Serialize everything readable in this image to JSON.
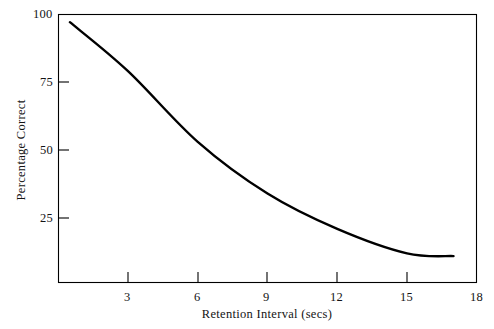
{
  "chart_data": {
    "type": "line",
    "title": "",
    "xlabel": "Retention Interval (secs)",
    "ylabel": "Percentage Correct",
    "xlim": [
      0.5,
      18
    ],
    "ylim": [
      1,
      100
    ],
    "grid": false,
    "legend": "none",
    "xticks": [
      3,
      6,
      9,
      12,
      15,
      18
    ],
    "xtick_labels": [
      "3",
      "6",
      "9",
      "12",
      "15",
      "18"
    ],
    "yticks": [
      25,
      50,
      75,
      100
    ],
    "ytick_labels": [
      "25",
      "50",
      "75",
      "100"
    ],
    "series": [
      {
        "name": "Percentage Correct",
        "color": "#000000",
        "x": [
          0.5,
          3,
          6,
          9,
          12,
          15,
          17
        ],
        "values": [
          97,
          79,
          53,
          34,
          21,
          12,
          11
        ]
      }
    ],
    "annotations": []
  },
  "axes": {
    "frame_color": "#000000",
    "line_color": "#000000",
    "background": "#ffffff"
  }
}
